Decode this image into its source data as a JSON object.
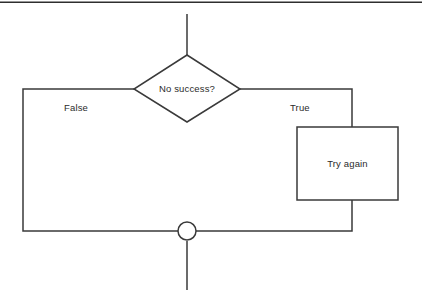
{
  "diagram": {
    "type": "flowchart",
    "orientation": "top-to-bottom",
    "background_color": "#ffffff",
    "line_color": "#3a3a3a",
    "text_color": "#2b2b2b",
    "top_rule": {
      "present": true,
      "color": "#2e2e2e"
    },
    "nodes": [
      {
        "id": "entry",
        "shape": "line-stub",
        "label": "",
        "role": "incoming-flow"
      },
      {
        "id": "decision",
        "shape": "diamond",
        "label": "No success?",
        "role": "decision"
      },
      {
        "id": "action",
        "shape": "rectangle",
        "label": "Try again",
        "role": "process"
      },
      {
        "id": "merge",
        "shape": "circle",
        "label": "",
        "role": "merge-junction"
      },
      {
        "id": "exit",
        "shape": "line-stub",
        "label": "",
        "role": "outgoing-flow"
      }
    ],
    "edges": [
      {
        "id": "entry-to-decision",
        "from": "entry",
        "to": "decision",
        "label": ""
      },
      {
        "id": "decision-false",
        "from": "decision",
        "to": "merge",
        "label": "False",
        "side": "left"
      },
      {
        "id": "decision-true",
        "from": "decision",
        "to": "action",
        "label": "True",
        "side": "right"
      },
      {
        "id": "action-to-merge",
        "from": "action",
        "to": "merge",
        "label": ""
      },
      {
        "id": "merge-to-exit",
        "from": "merge",
        "to": "exit",
        "label": ""
      }
    ]
  }
}
